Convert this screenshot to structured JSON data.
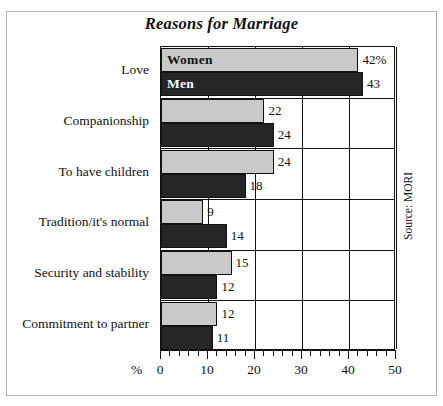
{
  "chart_data": {
    "type": "bar",
    "orientation": "horizontal",
    "title": "Reasons for Marriage",
    "xlabel": "%",
    "ylabel": "",
    "xlim": [
      0,
      50
    ],
    "xticks": [
      0,
      10,
      20,
      30,
      40,
      50
    ],
    "xtick_labels": [
      "0",
      "10",
      "20",
      "30",
      "40",
      "50"
    ],
    "minor_tick_step": 2,
    "grid": "vertical",
    "legend_position": "in-bars",
    "categories": [
      "Love",
      "Companionship",
      "To have children",
      "Tradition/it's normal",
      "Security and stability",
      "Commitment to partner"
    ],
    "series": [
      {
        "name": "Women",
        "color": "#c9c9c9",
        "values": [
          42,
          22,
          24,
          9,
          15,
          12
        ],
        "value_labels": [
          "42%",
          "22",
          "24",
          "9",
          "15",
          "12"
        ]
      },
      {
        "name": "Men",
        "color": "#262626",
        "values": [
          43,
          24,
          18,
          14,
          12,
          11
        ],
        "value_labels": [
          "43",
          "24",
          "18",
          "14",
          "12",
          "11"
        ]
      }
    ],
    "annotations": {
      "source": "Source: MORI"
    }
  },
  "colors": {
    "women_bar": "#c9c9c9",
    "men_bar": "#262626",
    "axis": "#111111",
    "frame": "#b4b4b4",
    "background": "#ffffff"
  }
}
